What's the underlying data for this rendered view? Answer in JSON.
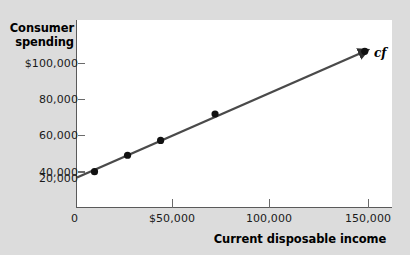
{
  "figure": {
    "background_color": "#dcdcdc",
    "plot_background_color": "#ffffff",
    "axis_color": "#5a5a5a",
    "line_color": "#4a4a4a",
    "marker_color": "#111111"
  },
  "axes": {
    "y_title_line1": "Consumer",
    "y_title_line2": "spending",
    "x_title": "Current disposable income",
    "y_ticks": [
      {
        "label": "0",
        "value": 0
      },
      {
        "label": "20,000",
        "value": 20000
      },
      {
        "label": "40,000",
        "value": 40000
      },
      {
        "label": "60,000",
        "value": 60000
      },
      {
        "label": "80,000",
        "value": 80000
      },
      {
        "label": "$100,000",
        "value": 100000
      }
    ],
    "x_ticks": [
      {
        "label": "$50,000",
        "value": 50000
      },
      {
        "label": "100,000",
        "value": 100000
      },
      {
        "label": "150,000",
        "value": 150000
      }
    ]
  },
  "series": {
    "label": "cf",
    "label_meaning": "consumption function"
  },
  "chart_data": {
    "type": "scatter",
    "title": "",
    "subtitle": "",
    "xlabel": "Current disposable income",
    "ylabel": "Consumer spending",
    "xlim": [
      0,
      162000
    ],
    "ylim": [
      0,
      114000
    ],
    "grid": false,
    "legend_position": "inline-right",
    "x_tick_labels": [
      "$50,000",
      "100,000",
      "150,000"
    ],
    "x_tick_values": [
      50000,
      100000,
      150000
    ],
    "y_tick_labels": [
      "0",
      "20,000",
      "40,000",
      "60,000",
      "80,000",
      "$100,000"
    ],
    "y_tick_values": [
      0,
      20000,
      40000,
      60000,
      80000,
      100000
    ],
    "series": [
      {
        "name": "cf",
        "type": "scatter",
        "marker": "filled-circle",
        "color": "#111111",
        "points": [
          {
            "x": 9000,
            "y": 22000
          },
          {
            "x": 26000,
            "y": 32000
          },
          {
            "x": 43000,
            "y": 41000
          },
          {
            "x": 71000,
            "y": 57000
          },
          {
            "x": 148000,
            "y": 95000
          }
        ]
      },
      {
        "name": "consumption function line",
        "type": "line",
        "color": "#4a4a4a",
        "annotation": "cf",
        "arrow_end": true,
        "endpoints": [
          {
            "x": 0,
            "y": 18500
          },
          {
            "x": 149000,
            "y": 95500
          }
        ],
        "intercept": 18500,
        "slope": 0.517
      }
    ],
    "annotations": [
      {
        "text": "cf",
        "x": 153000,
        "y": 100500,
        "style": "italic"
      }
    ]
  }
}
